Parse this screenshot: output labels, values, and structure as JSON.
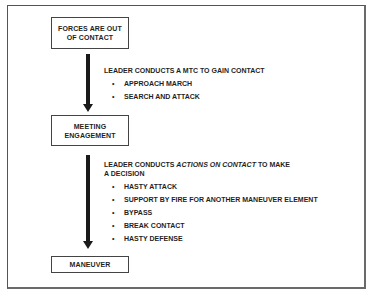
{
  "diagram": {
    "boxes": [
      {
        "id": "forces-out-of-contact",
        "label": "FORCES ARE OUT\nOF CONTACT"
      },
      {
        "id": "meeting-engagement",
        "label": "MEETING\nENGAGEMENT"
      },
      {
        "id": "maneuver",
        "label": "MANEUVER"
      }
    ],
    "transitions": [
      {
        "from": "forces-out-of-contact",
        "to": "meeting-engagement",
        "lead": "LEADER CONDUCTS A MTC TO GAIN CONTACT",
        "items": [
          "APPROACH MARCH",
          "SEARCH AND ATTACK"
        ]
      },
      {
        "from": "meeting-engagement",
        "to": "maneuver",
        "lead_prefix": "LEADER CONDUCTS ",
        "lead_emphasis": "ACTIONS ON CONTACT",
        "lead_suffix": " TO MAKE",
        "lead_line2": "A DECISION",
        "items": [
          "HASTY ATTACK",
          "SUPPORT BY FIRE FOR ANOTHER MANEUVER ELEMENT",
          "BYPASS",
          "BREAK CONTACT",
          "HASTY DEFENSE"
        ]
      }
    ],
    "bullet_glyph": "•",
    "colors": {
      "line": "#1a1a1a",
      "frame": "#555555",
      "text": "#1f1f1f"
    }
  }
}
